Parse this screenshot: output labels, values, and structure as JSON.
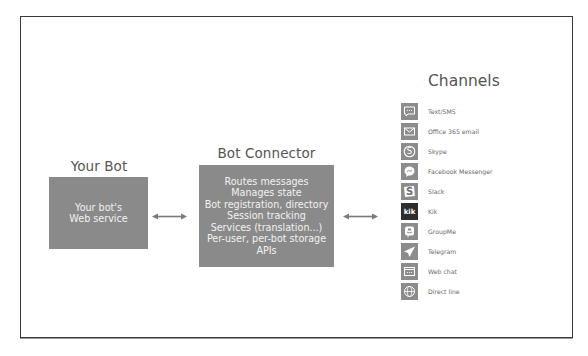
{
  "diagram": {
    "your_bot": {
      "title": "Your Bot",
      "box_lines": [
        "Your bot's",
        "Web service"
      ]
    },
    "bot_connector": {
      "title": "Bot Connector",
      "box_lines": [
        "Routes messages",
        "Manages state",
        "Bot registration, directory",
        "Session tracking",
        "Services (translation...)",
        "Per-user, per-bot storage",
        "APIs"
      ]
    },
    "channels": {
      "title": "Channels",
      "items": [
        {
          "label": "Text/SMS",
          "icon": "sms-icon"
        },
        {
          "label": "Office 365 email",
          "icon": "email-icon"
        },
        {
          "label": "Skype",
          "icon": "skype-icon"
        },
        {
          "label": "Facebook Messenger",
          "icon": "messenger-icon"
        },
        {
          "label": "Slack",
          "icon": "slack-icon"
        },
        {
          "label": "Kik",
          "icon": "kik-icon"
        },
        {
          "label": "GroupMe",
          "icon": "groupme-icon"
        },
        {
          "label": "Telegram",
          "icon": "telegram-icon"
        },
        {
          "label": "Web chat",
          "icon": "webchat-icon"
        },
        {
          "label": "Direct line",
          "icon": "directline-icon"
        }
      ]
    },
    "arrows": [
      "bidirectional",
      "bidirectional"
    ],
    "colors": {
      "box_fill": "#8a8a8a",
      "box_text": "#f2f2f2",
      "title_text": "#555555",
      "kik_icon_bg": "#2e2e2e",
      "icon_bg": "#8c8c8c",
      "frame_border": "#3a3a3a"
    }
  }
}
